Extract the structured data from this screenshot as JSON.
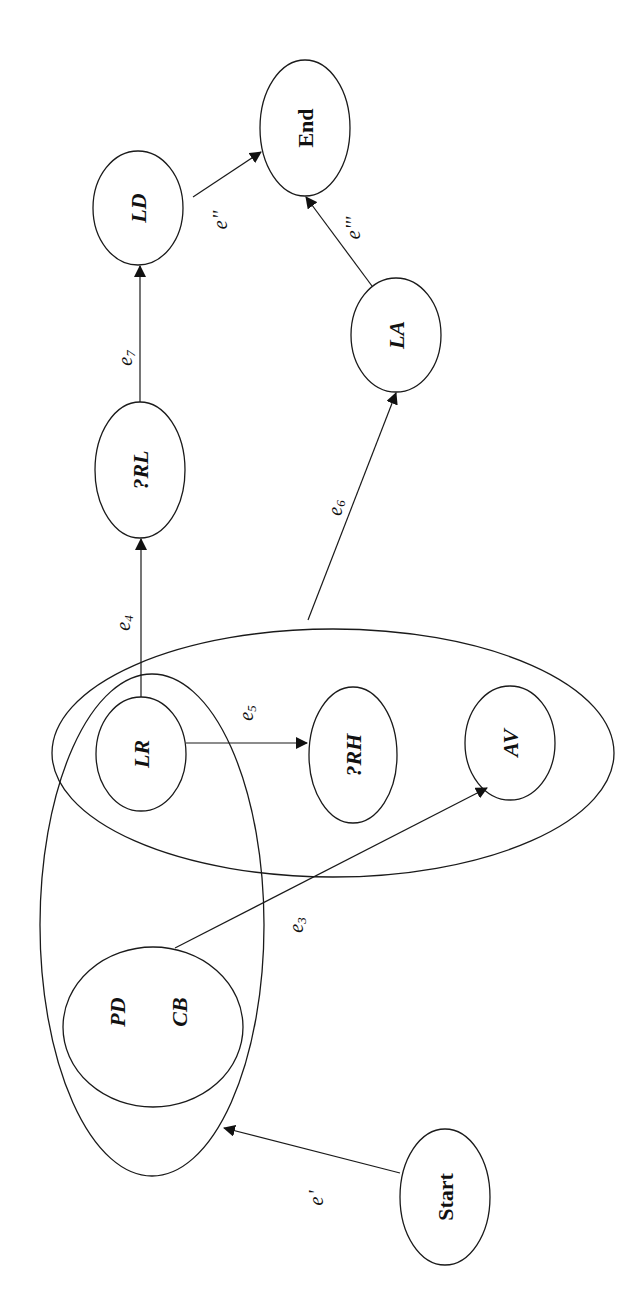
{
  "diagram": {
    "orientation": "rotated -90deg (text reads bottom-to-top)",
    "nodes": [
      {
        "id": "start",
        "label": "Start",
        "style": "upright"
      },
      {
        "id": "pd",
        "label": "PD",
        "style": "italic"
      },
      {
        "id": "cb",
        "label": "CB",
        "style": "italic"
      },
      {
        "id": "lr",
        "label": "LR",
        "style": "italic"
      },
      {
        "id": "rh",
        "label": "?RH",
        "style": "italic"
      },
      {
        "id": "av",
        "label": "AV",
        "style": "italic"
      },
      {
        "id": "rl",
        "label": "?RL",
        "style": "italic"
      },
      {
        "id": "ld",
        "label": "LD",
        "style": "italic"
      },
      {
        "id": "la",
        "label": "LA",
        "style": "italic"
      },
      {
        "id": "end",
        "label": "End",
        "style": "upright"
      }
    ],
    "groups": [
      {
        "id": "group-left",
        "contains": [
          "pd",
          "cb",
          "lr"
        ]
      },
      {
        "id": "group-pd-cb",
        "contains": [
          "pd",
          "cb"
        ]
      },
      {
        "id": "group-right",
        "contains": [
          "lr",
          "rh",
          "av"
        ]
      }
    ],
    "edges": [
      {
        "id": "e-prime",
        "base": "e",
        "mark": "'",
        "sub": "",
        "from": "start",
        "to": "group-left"
      },
      {
        "id": "e3",
        "base": "e",
        "mark": "",
        "sub": "3",
        "from": "group-pd-cb",
        "to": "av"
      },
      {
        "id": "e4",
        "base": "e",
        "mark": "",
        "sub": "4",
        "from": "lr",
        "to": "rl"
      },
      {
        "id": "e5",
        "base": "e",
        "mark": "",
        "sub": "5",
        "from": "lr",
        "to": "rh"
      },
      {
        "id": "e6",
        "base": "e",
        "mark": "",
        "sub": "6",
        "from": "group-right",
        "to": "la"
      },
      {
        "id": "e7",
        "base": "e",
        "mark": "",
        "sub": "7",
        "from": "rl",
        "to": "ld"
      },
      {
        "id": "e-dprime",
        "base": "e",
        "mark": "''",
        "sub": "",
        "from": "ld",
        "to": "end"
      },
      {
        "id": "e-tprime",
        "base": "e",
        "mark": "'''",
        "sub": "",
        "from": "la",
        "to": "end"
      }
    ]
  }
}
